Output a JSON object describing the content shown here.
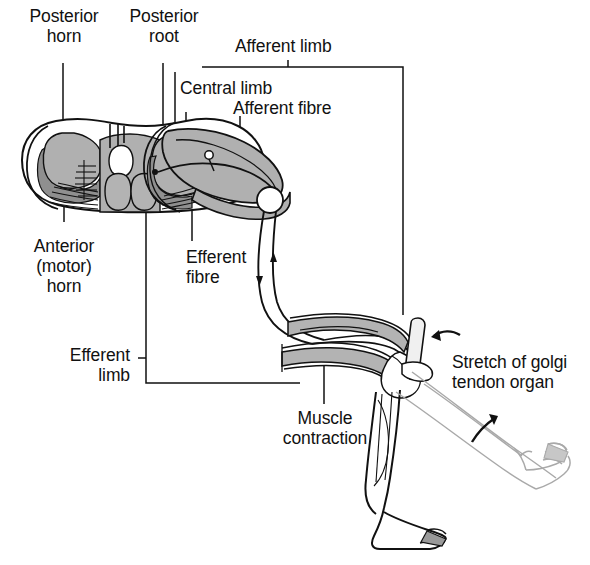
{
  "figure": {
    "domain": "anatomical-diagram",
    "colors": {
      "ink": "#111111",
      "gray_matter": "#a9a9a9",
      "gray_matter_dark": "#8a8a8a",
      "muscle": "#b3b3b3",
      "ghost_limb": "#b9b9b9",
      "background": "#ffffff"
    }
  },
  "labels": {
    "posterior_horn": "Posterior\nhorn",
    "posterior_root": "Posterior\nroot",
    "afferent_limb": "Afferent limb",
    "central_limb": "Central limb",
    "afferent_fibre": "Afferent fibre",
    "anterior_motor_horn": "Anterior\n(motor)\nhorn",
    "efferent_fibre": "Efferent\nfibre",
    "efferent_limb": "Efferent\nlimb",
    "muscle_contraction": "Muscle\ncontraction",
    "stretch_of_golgi_tendon_organ": "Stretch of golgi\ntendon organ"
  },
  "structures": [
    {
      "name": "spinal-cord-cross-section",
      "description": "Transverse section of spinal cord with butterfly shaped grey matter"
    },
    {
      "name": "posterior-horn",
      "description": "Dorsal grey horn receiving sensory input"
    },
    {
      "name": "anterior-motor-horn",
      "description": "Ventral grey horn containing motor neuron cell bodies"
    },
    {
      "name": "posterior-root",
      "description": "Dorsal nerve root"
    },
    {
      "name": "dorsal-root-ganglion",
      "description": "Swelling on dorsal root containing sensory cell body"
    },
    {
      "name": "afferent-fibre",
      "description": "Sensory fibre carrying impulse toward cord"
    },
    {
      "name": "efferent-fibre",
      "description": "Motor fibre carrying impulse to muscle"
    },
    {
      "name": "quadriceps-muscle",
      "description": "Shaded muscle belly that contracts"
    },
    {
      "name": "golgi-tendon-organ",
      "description": "Tendon receptor that is stretched"
    },
    {
      "name": "leg-extended",
      "description": "Ghosted outline of leg after reflex extension"
    }
  ],
  "annotations": {
    "arrow_stretch": "curved arrow indicating stretch at tendon",
    "arrow_extension": "curved arrow indicating leg swings upward",
    "flow_down": "arrowhead on efferent fibre pointing toward muscle",
    "flow_up": "arrowhead on afferent fibre pointing toward cord"
  }
}
